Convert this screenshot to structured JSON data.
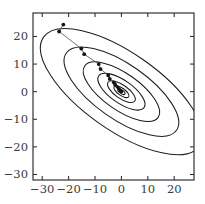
{
  "figure": {
    "title": "",
    "background_color": "#ffffff",
    "width": 205,
    "height": 204
  },
  "chart_data": {
    "type": "line",
    "title": "",
    "subtitle": "",
    "xlabel": "",
    "ylabel": "",
    "grid": false,
    "legend": null,
    "xlim": [
      -33.5,
      27.5
    ],
    "ylim": [
      -32.0,
      28.5
    ],
    "xticks": [
      -30,
      -20,
      -10,
      0,
      10,
      20
    ],
    "yticks": [
      -30,
      -20,
      -10,
      0,
      10,
      20
    ],
    "xticklabels": [
      "−30",
      "−20",
      "−10",
      "0",
      "10",
      "20"
    ],
    "yticklabels": [
      "−30",
      "−20",
      "−10",
      "0",
      "10",
      "20"
    ],
    "tick_direction": "in",
    "contours": {
      "kind": "ellipse",
      "center": [
        0,
        0
      ],
      "rotation_deg": -35,
      "semi_axes": [
        {
          "a": 1.6,
          "b": 0.62
        },
        {
          "a": 3.4,
          "b": 1.3
        },
        {
          "a": 6.2,
          "b": 2.4
        },
        {
          "a": 10.5,
          "b": 4.1
        },
        {
          "a": 17.0,
          "b": 6.6
        },
        {
          "a": 25.5,
          "b": 9.9
        },
        {
          "a": 36.0,
          "b": 14.0
        }
      ],
      "outermost_clipped_at_corners": true
    },
    "series": [
      {
        "name": "gradient-descent-path",
        "marker": "circle",
        "line_color": "#555555",
        "marker_color": "#151515",
        "x": [
          -22.0,
          -23.6,
          -15.2,
          -14.1,
          -8.6,
          -7.9,
          -5.0,
          -4.4,
          -2.9,
          -2.4,
          -1.7,
          -1.3,
          -0.9,
          -0.6,
          -0.4,
          -0.25,
          -0.15,
          -0.08,
          0.0
        ],
        "y": [
          24.3,
          21.8,
          15.6,
          13.6,
          10.0,
          8.2,
          5.9,
          4.6,
          3.4,
          2.6,
          1.9,
          1.4,
          1.0,
          0.7,
          0.45,
          0.3,
          0.18,
          0.09,
          0.0
        ]
      }
    ]
  }
}
